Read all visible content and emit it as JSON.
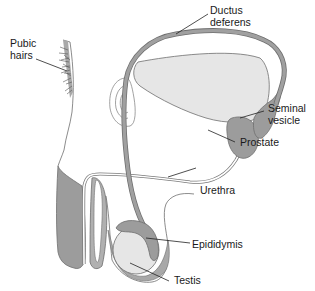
{
  "diagram": {
    "type": "anatomical-illustration",
    "colors": {
      "tissue_dark": "#9c9c9c",
      "tissue_light": "#e6e6e6",
      "outline": "#6e6e6e",
      "duct": "#8f8f8f",
      "leader_line": "#222222",
      "text": "#1a1a1a",
      "background": "#ffffff"
    }
  },
  "labels": {
    "pubic_hairs": "Pubic\nhairs",
    "ductus_deferens": "Ductus\ndeferens",
    "seminal_vesicle": "Seminal\nvesicle",
    "prostate": "Prostate",
    "urethra": "Urethra",
    "epididymis": "Epididymis",
    "testis": "Testis"
  }
}
